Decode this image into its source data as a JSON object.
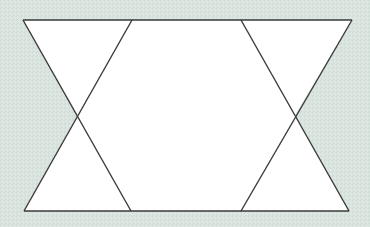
{
  "figure": {
    "type": "geometric-diagram",
    "background_color": "#d9e4de",
    "fill_color": "#ffffff",
    "stroke_color": "#3a3a3a",
    "vertices": {
      "top": [
        [
          23,
          20
        ],
        [
          132,
          20
        ],
        [
          241,
          20
        ],
        [
          352,
          20
        ]
      ],
      "bottom": [
        [
          24,
          211
        ],
        [
          131,
          211
        ],
        [
          241,
          211
        ],
        [
          349,
          211
        ]
      ],
      "crossings": [
        [
          78,
          115
        ],
        [
          295,
          115
        ]
      ]
    }
  }
}
